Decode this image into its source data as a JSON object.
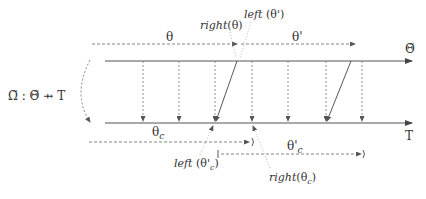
{
  "diagram": {
    "mapping_label": "Ω̃ : Θ̃ ⇸ T",
    "top_axis_label": "Θ̃",
    "bottom_axis_label": "T",
    "intervals_top": [
      {
        "label": "θ"
      },
      {
        "label": "θ'"
      }
    ],
    "intervals_bottom": [
      {
        "label": "θ",
        "subscript": "c"
      },
      {
        "label": "θ'",
        "subscript": "c"
      }
    ],
    "annotations": {
      "right_theta": {
        "fn": "right",
        "arg": "θ"
      },
      "left_theta_prime": {
        "fn": "left",
        "arg": "θ'"
      },
      "left_theta_c_prime": {
        "fn": "left",
        "arg": "θ'",
        "sub": "c"
      },
      "right_theta_c": {
        "fn": "right",
        "arg": "θ",
        "sub": "c"
      }
    }
  }
}
